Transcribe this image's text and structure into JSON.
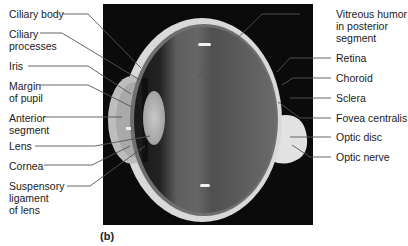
{
  "figure": {
    "panel_label": "(b)",
    "colors": {
      "background_photo": "#0b0b0b",
      "leader_line": "#555555",
      "tissue_light": "#d8d8d8",
      "vitreous": "#5a5a5a"
    },
    "labels_left": [
      {
        "id": "ciliary-body",
        "text": "Ciliary body"
      },
      {
        "id": "ciliary-processes",
        "text": "Ciliary\nprocesses"
      },
      {
        "id": "iris",
        "text": "Iris"
      },
      {
        "id": "margin-of-pupil",
        "text": "Margin\nof pupil"
      },
      {
        "id": "anterior-segment",
        "text": "Anterior\nsegment"
      },
      {
        "id": "lens",
        "text": "Lens"
      },
      {
        "id": "cornea",
        "text": "Cornea"
      },
      {
        "id": "suspensory-ligament",
        "text": "Suspensory\nligament\nof lens"
      }
    ],
    "labels_right": [
      {
        "id": "vitreous-humor",
        "text": "Vitreous humor\nin posterior\nsegment"
      },
      {
        "id": "retina",
        "text": "Retina"
      },
      {
        "id": "choroid",
        "text": "Choroid"
      },
      {
        "id": "sclera",
        "text": "Sclera"
      },
      {
        "id": "fovea-centralis",
        "text": "Fovea centralis"
      },
      {
        "id": "optic-disc",
        "text": "Optic disc"
      },
      {
        "id": "optic-nerve",
        "text": "Optic nerve"
      }
    ]
  }
}
